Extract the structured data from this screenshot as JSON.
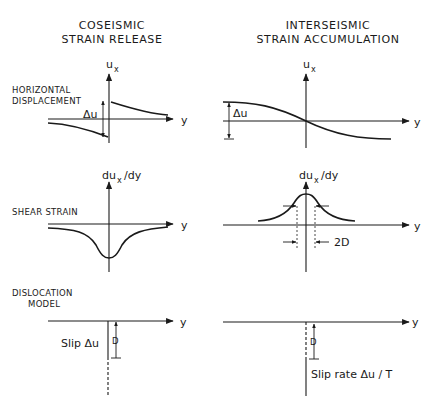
{
  "columns": {
    "left": {
      "title_line1": "COSEISMIC",
      "title_line2": "STRAIN RELEASE"
    },
    "right": {
      "title_line1": "INTERSEISMIC",
      "title_line2": "STRAIN ACCUMULATION"
    }
  },
  "rows": {
    "displacement": {
      "label_line1": "HORIZONTAL",
      "label_line2": "DISPLACEMENT"
    },
    "strain": {
      "label_line1": "SHEAR STRAIN"
    },
    "model": {
      "label_line1": "DISLOCATION",
      "label_line2": "MODEL"
    }
  },
  "axes": {
    "ux_main": "u",
    "ux_sub": "x",
    "dux_main": "du",
    "dux_sub": "x",
    "dux_tail": "/dy",
    "y": "y"
  },
  "annotations": {
    "delta_u": "Δu",
    "width_2d": "2D",
    "depth_d": "D",
    "slip_coseismic": "Slip  Δu",
    "slip_interseismic": "Slip rate  Δu / T"
  }
}
